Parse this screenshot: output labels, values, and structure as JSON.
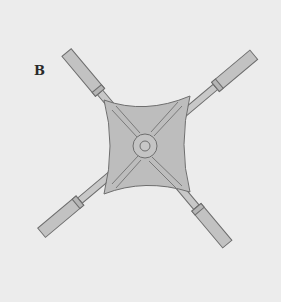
{
  "figure": {
    "label": "B",
    "colors": {
      "background": "#ececec",
      "body_fill": "#bdbdbd",
      "arm_fill": "#c8c8c8",
      "outline": "#6e6e6e"
    }
  }
}
